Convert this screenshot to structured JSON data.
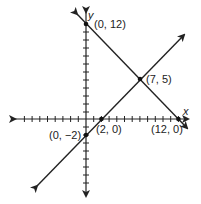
{
  "graph": {
    "x_axis_label": "x",
    "y_axis_label": "y",
    "lines": [
      {
        "name": "decreasing-line",
        "through": [
          [
            0,
            12
          ],
          [
            12,
            0
          ]
        ]
      },
      {
        "name": "increasing-line",
        "through": [
          [
            0,
            -2
          ],
          [
            2,
            0
          ]
        ]
      }
    ],
    "points": [
      {
        "label": "(0, 12)",
        "x": 0,
        "y": 12
      },
      {
        "label": "(7, 5)",
        "x": 7,
        "y": 5
      },
      {
        "label": "(2, 0)",
        "x": 2,
        "y": 0
      },
      {
        "label": "(12, 0)",
        "x": 12,
        "y": 0
      },
      {
        "label": "(0, −2)",
        "x": 0,
        "y": -2
      }
    ]
  }
}
